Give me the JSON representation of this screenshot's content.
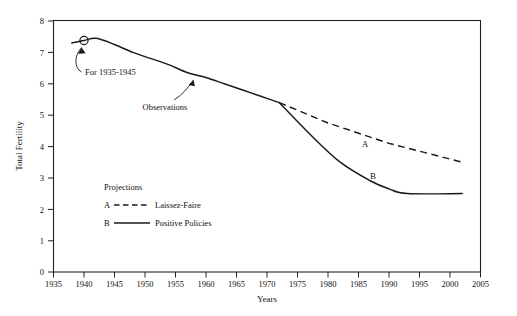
{
  "chart_data": {
    "type": "line",
    "title": "",
    "xlabel": "Years",
    "ylabel": "Total Fertility",
    "xlim": [
      1935,
      2005
    ],
    "ylim": [
      0,
      8
    ],
    "grid": false,
    "legend_position": "inner-lower-left",
    "xticks": [
      "1935",
      "1940",
      "1945",
      "1950",
      "1955",
      "1960",
      "1965",
      "1970",
      "1975",
      "1980",
      "1985",
      "1990",
      "1995",
      "2000",
      "2005"
    ],
    "yticks": [
      "0",
      "1",
      "2",
      "3",
      "4",
      "5",
      "6",
      "7",
      "8"
    ],
    "series": [
      {
        "name": "Observations",
        "style": "solid",
        "x": [
          1938,
          1940,
          1942,
          1945,
          1948,
          1951,
          1954,
          1957,
          1960,
          1963,
          1966,
          1969,
          1972
        ],
        "values": [
          7.3,
          7.38,
          7.45,
          7.25,
          7.0,
          6.8,
          6.6,
          6.35,
          6.2,
          6.0,
          5.8,
          5.6,
          5.4
        ]
      },
      {
        "name": "Laissez-Faire",
        "letter": "A",
        "style": "dashed",
        "x": [
          1972,
          1980,
          1990,
          2002
        ],
        "values": [
          5.4,
          4.75,
          4.1,
          3.5
        ]
      },
      {
        "name": "Positive Policies",
        "letter": "B",
        "style": "solid",
        "x": [
          1972,
          1977,
          1982,
          1987,
          1990,
          1993,
          2002
        ],
        "values": [
          5.4,
          4.4,
          3.5,
          2.9,
          2.65,
          2.5,
          2.5
        ]
      }
    ],
    "annotations": [
      {
        "id": "marker-1940",
        "text": "",
        "x": 1940,
        "y": 7.38,
        "shape": "circle"
      },
      {
        "id": "for-1935-1945",
        "text": "For 1935-1945",
        "x": 1942,
        "y": 6.6
      },
      {
        "id": "observations",
        "text": "Observations",
        "x": 1955,
        "y": 5.75
      }
    ],
    "legend": {
      "title": "Projections",
      "entries": [
        {
          "letter": "A",
          "style": "dashed",
          "label": "Laissez-Faire"
        },
        {
          "letter": "B",
          "style": "solid",
          "label": "Positive Policies"
        }
      ]
    }
  },
  "axes": {
    "x_title": "Years",
    "y_title": "Total Fertility",
    "x_ticks": [
      "1935",
      "1940",
      "1945",
      "1950",
      "1955",
      "1960",
      "1965",
      "1970",
      "1975",
      "1980",
      "1985",
      "1990",
      "1995",
      "2000",
      "2005"
    ],
    "y_ticks": [
      "8",
      "7",
      "6",
      "5",
      "4",
      "3",
      "2",
      "1",
      "0"
    ]
  },
  "labels": {
    "series_a_letter": "A",
    "series_b_letter": "B",
    "annotation_for": "For 1935-1945",
    "annotation_observations": "Observations"
  },
  "legend": {
    "title": "Projections",
    "a_letter": "A",
    "a_label": "Laissez-Faire",
    "b_letter": "B",
    "b_label": "Positive Policies"
  },
  "colors": {
    "ink": "#1a1a1a",
    "background": "#ffffff"
  }
}
